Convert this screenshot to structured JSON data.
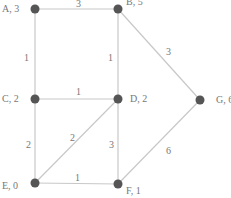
{
  "graph": {
    "nodes": [
      {
        "id": "A",
        "label": "A, 3",
        "x": 35,
        "y": 9,
        "lx": 2,
        "ly": 12,
        "anchor": "start"
      },
      {
        "id": "B",
        "label": "B, 5",
        "x": 118,
        "y": 9,
        "lx": 126,
        "ly": 5,
        "anchor": "start"
      },
      {
        "id": "C",
        "label": "C, 2",
        "x": 35,
        "y": 99,
        "lx": 2,
        "ly": 102,
        "anchor": "start"
      },
      {
        "id": "D",
        "label": "D, 2",
        "x": 118,
        "y": 99,
        "lx": 130,
        "ly": 102,
        "anchor": "start"
      },
      {
        "id": "G",
        "label": "G, 6",
        "x": 200,
        "y": 100,
        "lx": 216,
        "ly": 103,
        "anchor": "start"
      },
      {
        "id": "E",
        "label": "E, 0",
        "x": 35,
        "y": 183,
        "lx": 2,
        "ly": 189,
        "anchor": "start"
      },
      {
        "id": "F",
        "label": "F, 1",
        "x": 118,
        "y": 184,
        "lx": 126,
        "ly": 194,
        "anchor": "start"
      }
    ],
    "edges": [
      {
        "from": "A",
        "to": "B",
        "weight": "3",
        "wx": 76,
        "wy": 7
      },
      {
        "from": "A",
        "to": "C",
        "weight": "1",
        "wx": 24,
        "wy": 61
      },
      {
        "from": "B",
        "to": "D",
        "weight": "1",
        "wx": 108,
        "wy": 61
      },
      {
        "from": "B",
        "to": "G",
        "weight": "3",
        "wx": 166,
        "wy": 55
      },
      {
        "from": "C",
        "to": "D",
        "weight": "1",
        "wx": 76,
        "wy": 95
      },
      {
        "from": "C",
        "to": "E",
        "weight": "2",
        "wx": 26,
        "wy": 148
      },
      {
        "from": "E",
        "to": "D",
        "weight": "2",
        "wx": 70,
        "wy": 141
      },
      {
        "from": "D",
        "to": "F",
        "weight": "3",
        "wx": 109,
        "wy": 148
      },
      {
        "from": "E",
        "to": "F",
        "weight": "1",
        "wx": 75,
        "wy": 181
      },
      {
        "from": "F",
        "to": "G",
        "weight": "6",
        "wx": 166,
        "wy": 154
      }
    ]
  }
}
